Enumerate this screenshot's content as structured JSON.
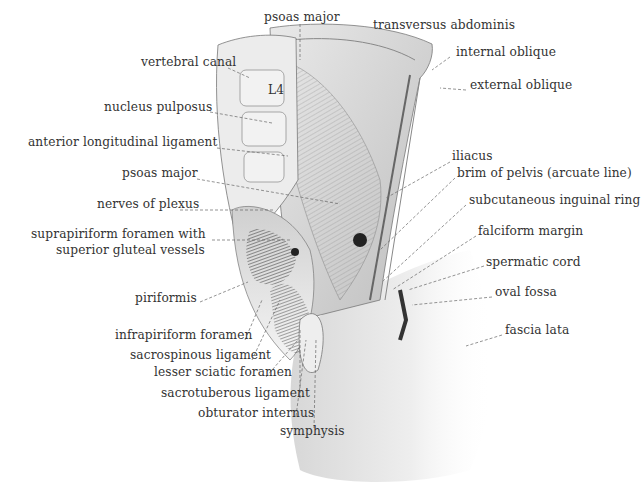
{
  "figure": {
    "labels_left": [
      {
        "id": "vertebral-canal",
        "text": "vertebral canal",
        "x": 141,
        "y": 61
      },
      {
        "id": "l4",
        "text": "L4",
        "x": 268,
        "y": 89
      },
      {
        "id": "nucleus-pulposus",
        "text": "nucleus pulposus",
        "x": 104,
        "y": 106
      },
      {
        "id": "anterior-longitudinal-ligament",
        "text": "anterior longitudinal ligament",
        "x": 28,
        "y": 141
      },
      {
        "id": "psoas-major-left",
        "text": "psoas major",
        "x": 122,
        "y": 172
      },
      {
        "id": "nerves-of-plexus",
        "text": "nerves of plexus",
        "x": 97,
        "y": 203
      },
      {
        "id": "suprapiriform-foramen",
        "text": "suprapiriform foramen with",
        "x": 31,
        "y": 233
      },
      {
        "id": "superior-gluteal-vessels",
        "text": "superior gluteal vessels",
        "x": 56,
        "y": 249
      },
      {
        "id": "piriformis",
        "text": "piriformis",
        "x": 135,
        "y": 297
      },
      {
        "id": "infrapiriform-foramen",
        "text": "infrapiriform foramen",
        "x": 115,
        "y": 334
      },
      {
        "id": "sacrospinous-ligament",
        "text": "sacrospinous ligament",
        "x": 130,
        "y": 354
      },
      {
        "id": "lesser-sciatic-foramen",
        "text": "lesser sciatic foramen",
        "x": 154,
        "y": 371
      },
      {
        "id": "sacrotuberous-ligament",
        "text": "sacrotuberous ligament",
        "x": 161,
        "y": 392
      },
      {
        "id": "obturator-internus",
        "text": "obturator internus",
        "x": 198,
        "y": 412
      },
      {
        "id": "symphysis",
        "text": "symphysis",
        "x": 280,
        "y": 430
      }
    ],
    "labels_right": [
      {
        "id": "psoas-major-top",
        "text": "psoas major",
        "x": 264,
        "y": 17
      },
      {
        "id": "transversus-abdominis",
        "text": "transversus abdominis",
        "x": 373,
        "y": 24
      },
      {
        "id": "internal-oblique",
        "text": "internal oblique",
        "x": 456,
        "y": 51
      },
      {
        "id": "external-oblique",
        "text": "external oblique",
        "x": 470,
        "y": 84
      },
      {
        "id": "iliacus",
        "text": "iliacus",
        "x": 452,
        "y": 155
      },
      {
        "id": "brim-of-pelvis",
        "text": "brim of pelvis (arcuate line)",
        "x": 457,
        "y": 172
      },
      {
        "id": "subcutaneous-inguinal-ring",
        "text": "subcutaneous inguinal ring",
        "x": 469,
        "y": 199
      },
      {
        "id": "falciform-margin",
        "text": "falciform margin",
        "x": 478,
        "y": 230
      },
      {
        "id": "spermatic-cord",
        "text": "spermatic cord",
        "x": 486,
        "y": 261
      },
      {
        "id": "oval-fossa",
        "text": "oval fossa",
        "x": 495,
        "y": 291
      },
      {
        "id": "fascia-lata",
        "text": "fascia lata",
        "x": 505,
        "y": 329
      }
    ]
  },
  "colors": {
    "label": "#333333",
    "ink": "#555555",
    "shade": "#9a9a9a",
    "dark": "#2a2a2a",
    "background": "#ffffff"
  }
}
